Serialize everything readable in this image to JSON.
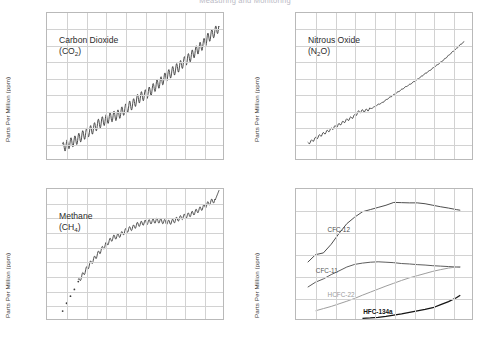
{
  "figure": {
    "title": "Measuring and Monitoring",
    "axis_label_y": "Parts Per Million (ppm)"
  },
  "chart_data": [
    {
      "type": "line",
      "panel": "top-left",
      "title": "Carbon Dioxide",
      "title_sub": "(CO2)",
      "species_name": "Carbon Dioxide",
      "species_formula_main": "CO",
      "species_formula_sub": "2",
      "xlabel": "",
      "ylabel": "Parts Per Million (ppm)",
      "xlim": [
        1975,
        2020
      ],
      "ylim": [
        330,
        420
      ],
      "xticks": [
        1975,
        1980,
        1985,
        1990,
        1995,
        2000,
        2005,
        2010,
        2015,
        2020
      ],
      "yticks": [
        330,
        340,
        350,
        360,
        370,
        380,
        390,
        400,
        410,
        420
      ],
      "grid": true,
      "color": "#3a3a3a",
      "seasonal_cycle": true,
      "x": [
        1979,
        1980,
        1981,
        1982,
        1983,
        1984,
        1985,
        1986,
        1987,
        1988,
        1989,
        1990,
        1991,
        1992,
        1993,
        1994,
        1995,
        1996,
        1997,
        1998,
        1999,
        2000,
        2001,
        2002,
        2003,
        2004,
        2005,
        2006,
        2007,
        2008,
        2009,
        2010,
        2011,
        2012,
        2013,
        2014,
        2015,
        2016,
        2017,
        2018,
        2019
      ],
      "values": [
        337.0,
        338.6,
        339.9,
        341.0,
        342.6,
        344.2,
        345.8,
        347.3,
        349.0,
        351.3,
        352.8,
        354.2,
        355.5,
        356.3,
        357.0,
        358.8,
        360.7,
        362.5,
        363.7,
        366.5,
        368.3,
        369.4,
        371.0,
        373.1,
        375.6,
        377.3,
        379.7,
        381.8,
        383.7,
        385.5,
        387.3,
        389.8,
        391.6,
        393.8,
        396.4,
        398.6,
        400.8,
        404.2,
        406.5,
        408.5,
        411.5
      ]
    },
    {
      "type": "line",
      "panel": "top-right",
      "title": "Nitrous Oxide",
      "title_sub": "(N2O)",
      "species_name": "Nitrous Oxide",
      "species_formula_pre": "(N",
      "species_formula_sub": "2",
      "species_formula_post": "O)",
      "xlabel": "",
      "ylabel": "Parts Per Million (ppm)",
      "xlim": [
        1975,
        2020
      ],
      "ylim": [
        295,
        340
      ],
      "xticks": [
        1975,
        1980,
        1985,
        1990,
        1995,
        2000,
        2005,
        2010,
        2015,
        2020
      ],
      "yticks": [
        295,
        300,
        305,
        310,
        315,
        320,
        325,
        330,
        335,
        340
      ],
      "grid": true,
      "color": "#3a3a3a",
      "seasonal_cycle": false,
      "x": [
        1978,
        1979,
        1980,
        1981,
        1982,
        1983,
        1984,
        1985,
        1986,
        1987,
        1988,
        1989,
        1990,
        1991,
        1992,
        1993,
        1994,
        1995,
        1996,
        1997,
        1998,
        1999,
        2000,
        2001,
        2002,
        2003,
        2004,
        2005,
        2006,
        2007,
        2008,
        2009,
        2010,
        2011,
        2012,
        2013,
        2014,
        2015,
        2016,
        2017,
        2018
      ],
      "values": [
        299.8,
        300.5,
        301.3,
        302.1,
        302.8,
        303.5,
        304.2,
        304.9,
        305.6,
        306.3,
        307.0,
        307.6,
        308.3,
        309.5,
        309.8,
        310.0,
        310.5,
        311.0,
        311.8,
        312.3,
        313.2,
        314.0,
        314.8,
        315.6,
        316.4,
        317.2,
        317.9,
        318.7,
        319.5,
        320.4,
        321.3,
        322.1,
        323.0,
        323.9,
        324.8,
        325.8,
        326.9,
        328.0,
        329.0,
        330.2,
        331.2
      ]
    },
    {
      "type": "line",
      "panel": "bottom-left",
      "title": "Methane",
      "title_sub": "(CH4)",
      "species_name": "Methane",
      "species_formula_pre": "(CH",
      "species_formula_sub": "4",
      "species_formula_post": ")",
      "xlabel": "",
      "ylabel": "Parts Per Million (ppm)",
      "xlim": [
        1975,
        2020
      ],
      "ylim": [
        1550,
        1880
      ],
      "xticks": [
        1975,
        1980,
        1985,
        1990,
        1995,
        2000,
        2005,
        2010,
        2015,
        2020
      ],
      "yticks": [
        1150,
        1600,
        1650,
        1700,
        1750,
        1800,
        1850,
        1860,
        1870,
        1880
      ],
      "ytick_labels": [
        "1150",
        "1600",
        "1650",
        "1700",
        "1750",
        "1800",
        "1850",
        "1860",
        "1870",
        "1880"
      ],
      "grid": true,
      "color": "#3a3a3a",
      "seasonal_cycle": true,
      "x": [
        1979,
        1980,
        1981,
        1982,
        1983,
        1984,
        1985,
        1986,
        1987,
        1988,
        1989,
        1990,
        1991,
        1992,
        1993,
        1994,
        1995,
        1996,
        1997,
        1998,
        1999,
        2000,
        2001,
        2002,
        2003,
        2004,
        2005,
        2006,
        2007,
        2008,
        2009,
        2010,
        2011,
        2012,
        2013,
        2014,
        2015,
        2016,
        2017,
        2018,
        2019
      ],
      "values": [
        1570,
        1590,
        1608,
        1625,
        1645,
        1660,
        1675,
        1690,
        1702,
        1715,
        1727,
        1738,
        1748,
        1757,
        1760,
        1765,
        1773,
        1778,
        1782,
        1789,
        1792,
        1795,
        1796,
        1798,
        1800,
        1799,
        1797,
        1795,
        1797,
        1802,
        1806,
        1810,
        1813,
        1817,
        1822,
        1828,
        1834,
        1841,
        1848,
        1852,
        1877
      ]
    },
    {
      "type": "line",
      "panel": "bottom-right",
      "title": "",
      "xlabel": "",
      "ylabel": "Parts Per Million (ppm)",
      "xlim": [
        1975,
        2020
      ],
      "ylim": [
        0,
        600
      ],
      "xticks": [
        1975,
        1980,
        1985,
        1990,
        1995,
        2000,
        2005,
        2010,
        2015,
        2020
      ],
      "yticks": [
        0,
        100,
        200,
        300,
        400,
        500,
        600
      ],
      "grid": true,
      "series": [
        {
          "name": "CFC-12",
          "color": "#4a4a4a",
          "label_x": 1983,
          "label_y": 415,
          "x": [
            1978,
            1980,
            1982,
            1984,
            1986,
            1988,
            1990,
            1992,
            1994,
            1996,
            1998,
            2000,
            2002,
            2004,
            2006,
            2008,
            2010,
            2012,
            2014,
            2016,
            2017
          ],
          "values": [
            262,
            297,
            305,
            345,
            395,
            440,
            470,
            495,
            505,
            515,
            525,
            538,
            537,
            536,
            536,
            532,
            525,
            518,
            512,
            505,
            502
          ]
        },
        {
          "name": "CFC-11",
          "color": "#5a5a5a",
          "label_x": 1980,
          "label_y": 228,
          "x": [
            1978,
            1980,
            1982,
            1984,
            1986,
            1988,
            1990,
            1992,
            1994,
            1996,
            1998,
            2000,
            2002,
            2004,
            2006,
            2008,
            2010,
            2012,
            2014,
            2016,
            2017
          ],
          "values": [
            147,
            170,
            185,
            205,
            222,
            240,
            252,
            258,
            262,
            264,
            262,
            260,
            256,
            254,
            251,
            249,
            246,
            244,
            242,
            240,
            239
          ]
        },
        {
          "name": "HCFC-22",
          "color": "#9b9b9b",
          "label_x": 1983,
          "label_y": 118,
          "x": [
            1980,
            1982,
            1984,
            1986,
            1988,
            1990,
            1992,
            1994,
            1996,
            1998,
            2000,
            2002,
            2004,
            2006,
            2008,
            2010,
            2012,
            2014,
            2016,
            2017
          ],
          "values": [
            38,
            48,
            58,
            70,
            82,
            95,
            110,
            124,
            138,
            152,
            165,
            178,
            190,
            200,
            210,
            220,
            228,
            235,
            240,
            242
          ]
        },
        {
          "name": "HFC-134a",
          "color": "#141414",
          "label_x": 1992,
          "label_y": 42,
          "x": [
            1992,
            1994,
            1996,
            1998,
            2000,
            2002,
            2004,
            2006,
            2008,
            2010,
            2012,
            2014,
            2016,
            2017
          ],
          "values": [
            3,
            5,
            8,
            12,
            18,
            24,
            31,
            38,
            44,
            52,
            66,
            80,
            98,
            110
          ]
        }
      ]
    }
  ]
}
